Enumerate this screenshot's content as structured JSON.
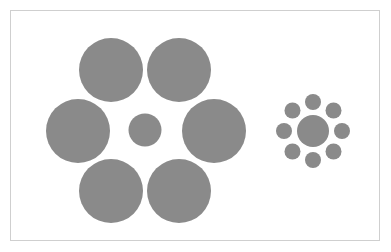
{
  "figure": {
    "fill_color": "#8a8a8a",
    "frame_color": "#cfcfcf",
    "background_color": "#ffffff"
  },
  "left_group": {
    "center_circle": {
      "cx": 145,
      "cy": 130,
      "r": 16.5
    },
    "surrounding_circles": [
      {
        "cx": 111,
        "cy": 70,
        "r": 32
      },
      {
        "cx": 179,
        "cy": 70,
        "r": 32
      },
      {
        "cx": 78,
        "cy": 131,
        "r": 32
      },
      {
        "cx": 214,
        "cy": 131,
        "r": 32
      },
      {
        "cx": 111,
        "cy": 191,
        "r": 32
      },
      {
        "cx": 179,
        "cy": 191,
        "r": 32
      }
    ]
  },
  "right_group": {
    "center_circle": {
      "cx": 313,
      "cy": 131,
      "r": 16
    },
    "orbit_radius": 29,
    "satellite_radius": 8,
    "satellite_count": 8
  }
}
